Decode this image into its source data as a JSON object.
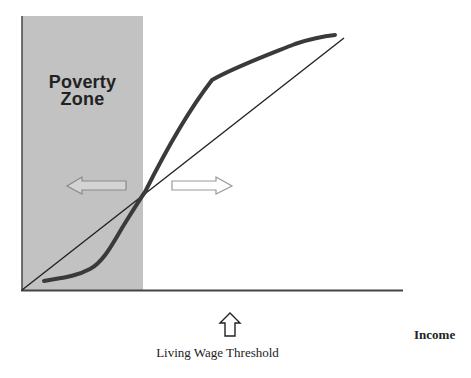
{
  "diagram": {
    "zone_label_line1": "Poverty",
    "zone_label_line2": "Zone",
    "threshold_label": "Living Wage Threshold",
    "x_axis_label": "Income",
    "colors": {
      "poverty_zone": "#c2c2c2",
      "curve": "#3a3a3a",
      "line": "#222222",
      "axis": "#444444",
      "arrow_outline": "#8a8a8a"
    },
    "arrows": [
      "left-arrow",
      "right-arrow",
      "up-arrow"
    ]
  }
}
